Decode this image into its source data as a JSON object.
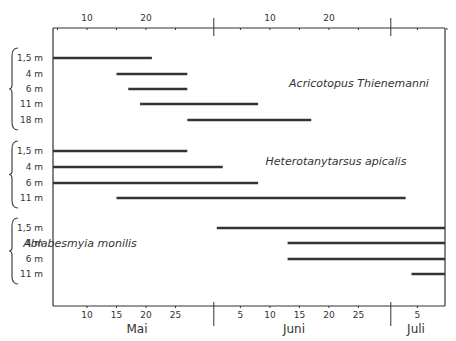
{
  "chart_data": {
    "type": "timeline",
    "title": "",
    "xlabel": "Date (May–July)",
    "ylabel": "Depth",
    "x_axis_bottom": {
      "months": [
        {
          "label": "Mai",
          "ticks": [
            "10",
            "15",
            "20",
            "25"
          ]
        },
        {
          "label": "Juni",
          "ticks": [
            "5",
            "10",
            "15",
            "20",
            "25"
          ]
        },
        {
          "label": "Juli",
          "ticks": [
            "5"
          ]
        }
      ]
    },
    "x_axis_top": {
      "ticks": [
        "10",
        "20",
        "10",
        "20"
      ]
    },
    "x_range_days": [
      "May 4",
      "July 11"
    ],
    "groups": [
      {
        "species": "Acricotopus Thienemanni",
        "bars": [
          {
            "depth": "1,5 m",
            "start": "May 4",
            "end": "May 21"
          },
          {
            "depth": "4 m",
            "start": "May 15",
            "end": "May 27"
          },
          {
            "depth": "6 m",
            "start": "May 17",
            "end": "May 27"
          },
          {
            "depth": "11 m",
            "start": "May 19",
            "end": "June 8"
          },
          {
            "depth": "18 m",
            "start": "May 27",
            "end": "June 17"
          }
        ]
      },
      {
        "species": "Heterotanytarsus apicalis",
        "bars": [
          {
            "depth": "1,5 m",
            "start": "May 4",
            "end": "May 27"
          },
          {
            "depth": "4 m",
            "start": "May 4",
            "end": "June 2"
          },
          {
            "depth": "6 m",
            "start": "May 4",
            "end": "June 8"
          },
          {
            "depth": "11 m",
            "start": "May 15",
            "end": "July 3"
          }
        ]
      },
      {
        "species": "Ablabesmyia monilis",
        "bars": [
          {
            "depth": "1,5 m",
            "start": "June 1",
            "end": "July 11"
          },
          {
            "depth": "4 m",
            "start": "June 13",
            "end": "July 11"
          },
          {
            "depth": "6 m",
            "start": "June 13",
            "end": "July 11"
          },
          {
            "depth": "11 m",
            "start": "July 4",
            "end": "July 11"
          }
        ]
      }
    ],
    "grid": false,
    "legend": "none (species labels inline)"
  },
  "labels": {
    "species1": "Acricotopus Thienemanni",
    "species2": "Heterotanytarsus apicalis",
    "species3": "Ablabesmyia monilis",
    "months": [
      "Mai",
      "Juni",
      "Juli"
    ]
  }
}
